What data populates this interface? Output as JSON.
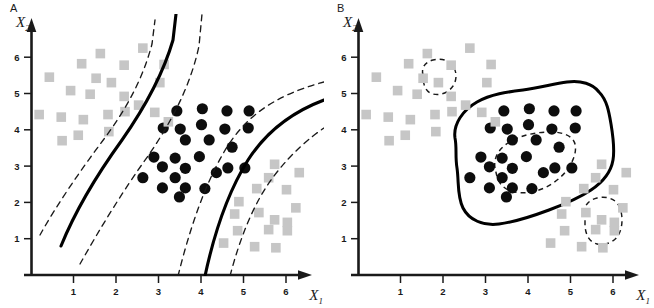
{
  "figure": {
    "panels": [
      {
        "id": "A",
        "label": "A",
        "axes": {
          "x_label": "X",
          "x_sub": "1",
          "y_label": "X",
          "y_sub": "2",
          "x_ticks": [
            "1",
            "2",
            "3",
            "4",
            "5",
            "6"
          ],
          "y_ticks": [
            "1",
            "2",
            "3",
            "4",
            "5",
            "6"
          ],
          "xlim": [
            0,
            6.8
          ],
          "ylim": [
            0,
            6.8
          ]
        }
      },
      {
        "id": "B",
        "label": "B",
        "axes": {
          "x_label": "X",
          "x_sub": "1",
          "y_label": "X",
          "y_sub": "2",
          "x_ticks": [
            "1",
            "2",
            "3",
            "4",
            "5",
            "6"
          ],
          "y_ticks": [
            "1",
            "2",
            "3",
            "4",
            "5",
            "6"
          ],
          "xlim": [
            0,
            6.8
          ],
          "ylim": [
            0,
            6.8
          ]
        }
      }
    ]
  },
  "colors": {
    "square_fill": "#c6c6c6",
    "circle_fill": "#0d0d0d",
    "axis": "#1a1a1a",
    "boundary_solid": "#000000",
    "boundary_dashed": "#1a1a1a",
    "background": "#ffffff"
  },
  "chart_data": {
    "type": "scatter",
    "title": "",
    "xlabel": "X1",
    "ylabel": "X2",
    "xlim": [
      0,
      6.8
    ],
    "ylim": [
      0,
      6.8
    ],
    "grid": false,
    "legend": null,
    "series": [
      {
        "name": "class-black-circles",
        "marker": "circle",
        "color": "#0d0d0d",
        "points": [
          [
            3.42,
            4.52
          ],
          [
            4.02,
            4.58
          ],
          [
            4.6,
            4.52
          ],
          [
            5.12,
            4.52
          ],
          [
            3.1,
            4.05
          ],
          [
            3.5,
            4.02
          ],
          [
            4.0,
            4.14
          ],
          [
            4.55,
            4.02
          ],
          [
            5.1,
            4.05
          ],
          [
            3.62,
            3.72
          ],
          [
            4.18,
            3.72
          ],
          [
            4.72,
            3.52
          ],
          [
            2.88,
            3.25
          ],
          [
            3.38,
            3.22
          ],
          [
            3.95,
            3.26
          ],
          [
            3.08,
            2.98
          ],
          [
            3.62,
            2.94
          ],
          [
            4.35,
            2.82
          ],
          [
            4.62,
            2.95
          ],
          [
            5.02,
            2.95
          ],
          [
            2.62,
            2.68
          ],
          [
            3.38,
            2.68
          ],
          [
            3.08,
            2.4
          ],
          [
            3.62,
            2.4
          ],
          [
            4.08,
            2.38
          ],
          [
            3.48,
            2.15
          ]
        ]
      },
      {
        "name": "class-gray-squares-upper-left",
        "marker": "square",
        "color": "#c6c6c6",
        "points": [
          [
            2.62,
            6.25
          ],
          [
            1.62,
            6.1
          ],
          [
            1.18,
            5.82
          ],
          [
            2.18,
            5.78
          ],
          [
            3.12,
            5.8
          ],
          [
            0.42,
            5.45
          ],
          [
            1.88,
            5.3
          ],
          [
            1.52,
            5.42
          ],
          [
            3.02,
            5.3
          ],
          [
            0.92,
            5.08
          ],
          [
            1.38,
            4.98
          ],
          [
            2.18,
            4.92
          ],
          [
            2.52,
            4.68
          ],
          [
            2.2,
            4.5
          ],
          [
            1.8,
            4.42
          ],
          [
            2.9,
            4.48
          ],
          [
            0.18,
            4.42
          ],
          [
            0.7,
            4.35
          ],
          [
            1.22,
            4.28
          ],
          [
            3.22,
            4.22
          ],
          [
            1.1,
            3.85
          ],
          [
            1.82,
            3.95
          ],
          [
            0.72,
            3.7
          ]
        ]
      },
      {
        "name": "class-gray-squares-lower-right",
        "marker": "square",
        "color": "#c6c6c6",
        "points": [
          [
            6.3,
            2.82
          ],
          [
            5.72,
            3.05
          ],
          [
            5.3,
            2.38
          ],
          [
            6.0,
            2.35
          ],
          [
            5.58,
            2.68
          ],
          [
            4.88,
            2.02
          ],
          [
            5.35,
            1.72
          ],
          [
            4.78,
            1.68
          ],
          [
            5.72,
            1.52
          ],
          [
            6.22,
            1.85
          ],
          [
            6.02,
            1.45
          ],
          [
            4.85,
            1.22
          ],
          [
            5.58,
            1.25
          ],
          [
            6.02,
            1.22
          ],
          [
            4.52,
            0.88
          ],
          [
            5.25,
            0.78
          ],
          [
            5.75,
            0.75
          ]
        ]
      }
    ],
    "panel_a_boundaries": {
      "description": "Two solid decision boundaries each flanked by two dashed margin curves, separating the central black-circle class from the gray-square classes",
      "solid_curves": 2,
      "dashed_margin_curves": 4
    },
    "panel_b_boundaries": {
      "description": "One large irregular solid closed contour enclosing the black circles, one inner dashed closed contour, and two small dashed closed contours over gray-square outliers",
      "solid_contours": 1,
      "dashed_contours": 3
    }
  }
}
